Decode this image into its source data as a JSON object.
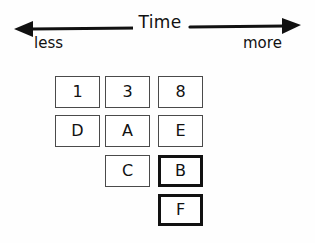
{
  "axis": {
    "title": "Time",
    "left_label": "less",
    "right_label": "more",
    "direction": "double-arrow",
    "color": "#111111"
  },
  "grid": {
    "columns": 3,
    "rows": 4,
    "cells": [
      [
        {
          "label": "1",
          "emphasis": "normal",
          "present": true
        },
        {
          "label": "3",
          "emphasis": "normal",
          "present": true
        },
        {
          "label": "8",
          "emphasis": "normal",
          "present": true
        }
      ],
      [
        {
          "label": "D",
          "emphasis": "normal",
          "present": true
        },
        {
          "label": "A",
          "emphasis": "normal",
          "present": true
        },
        {
          "label": "E",
          "emphasis": "normal",
          "present": true
        }
      ],
      [
        {
          "label": "",
          "emphasis": "none",
          "present": false
        },
        {
          "label": "C",
          "emphasis": "normal",
          "present": true
        },
        {
          "label": "B",
          "emphasis": "bold",
          "present": true
        }
      ],
      [
        {
          "label": "",
          "emphasis": "none",
          "present": false
        },
        {
          "label": "",
          "emphasis": "none",
          "present": false
        },
        {
          "label": "F",
          "emphasis": "bold",
          "present": true
        }
      ]
    ]
  },
  "colors": {
    "background": "#fefefe",
    "ink": "#111111",
    "box_border": "#4a4a4a",
    "box_border_bold": "#111111"
  }
}
